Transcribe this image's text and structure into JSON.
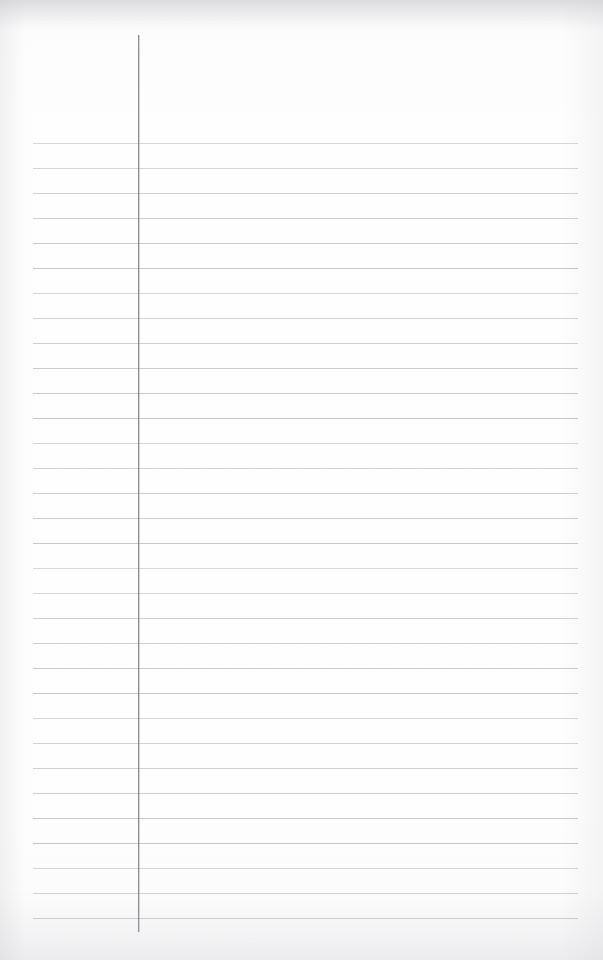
{
  "document": {
    "kind": "scanned-lined-paper",
    "title": "Blank Lined Notebook Page",
    "content_text": "",
    "page_width": 603,
    "page_height": 960,
    "paper_color": "#fdfdfd",
    "background_color": "#ffffff"
  },
  "ruling": {
    "type": "wide-ruled-single-margin",
    "line_color": "#80828c",
    "line_opacity": 0.38,
    "line_thickness_px": 1,
    "line_start_x": 33,
    "line_end_x": 578,
    "first_line_y": 143,
    "line_spacing_px": 25.0,
    "line_count": 32,
    "line_positions_y": [
      143,
      168,
      193,
      218,
      243,
      268,
      293,
      318,
      343,
      368,
      393,
      418,
      443,
      468,
      493,
      518,
      543,
      568,
      593,
      618,
      643,
      668,
      693,
      718,
      743,
      768,
      793,
      818,
      843,
      868,
      893,
      918
    ]
  },
  "margin_rule": {
    "name": "vertical-margin-line",
    "color": "#787a82",
    "thickness_px": 1,
    "x": 138,
    "top_y": 35,
    "bottom_y": 932
  },
  "edges": {
    "top_shadow_color": "#afafb6",
    "side_shadow_color": "#bebec3",
    "bottom_shadow_color": "#c8c8ce"
  }
}
